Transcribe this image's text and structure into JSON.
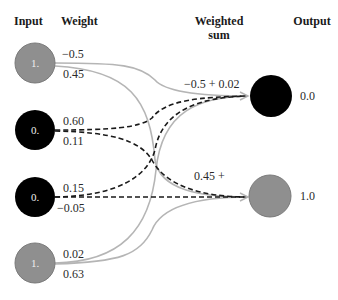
{
  "headers": {
    "input": "Input",
    "weight": "Weight",
    "weighted_sum_line1": "Weighted",
    "weighted_sum_line2": "sum",
    "output": "Output"
  },
  "colors": {
    "active_node": "#8f8f8f",
    "inactive_node": "#000000",
    "active_edge": "#b5b5b5",
    "inactive_edge": "#1a1a1a"
  },
  "inputs": [
    {
      "value": "1.",
      "state": "active",
      "weights": [
        "−0.5",
        "0.45"
      ]
    },
    {
      "value": "0.",
      "state": "inactive",
      "weights": [
        "0.60",
        "0.11"
      ]
    },
    {
      "value": "0.",
      "state": "inactive",
      "weights": [
        "0.15",
        "−0.05"
      ]
    },
    {
      "value": "1.",
      "state": "active",
      "weights": [
        "0.02",
        "0.63"
      ]
    }
  ],
  "weighted_sums": [
    "−0.5 + 0.02",
    "0.45 +"
  ],
  "outputs": [
    {
      "value": "0.0",
      "state": "inactive"
    },
    {
      "value": "1.0",
      "state": "active"
    }
  ]
}
